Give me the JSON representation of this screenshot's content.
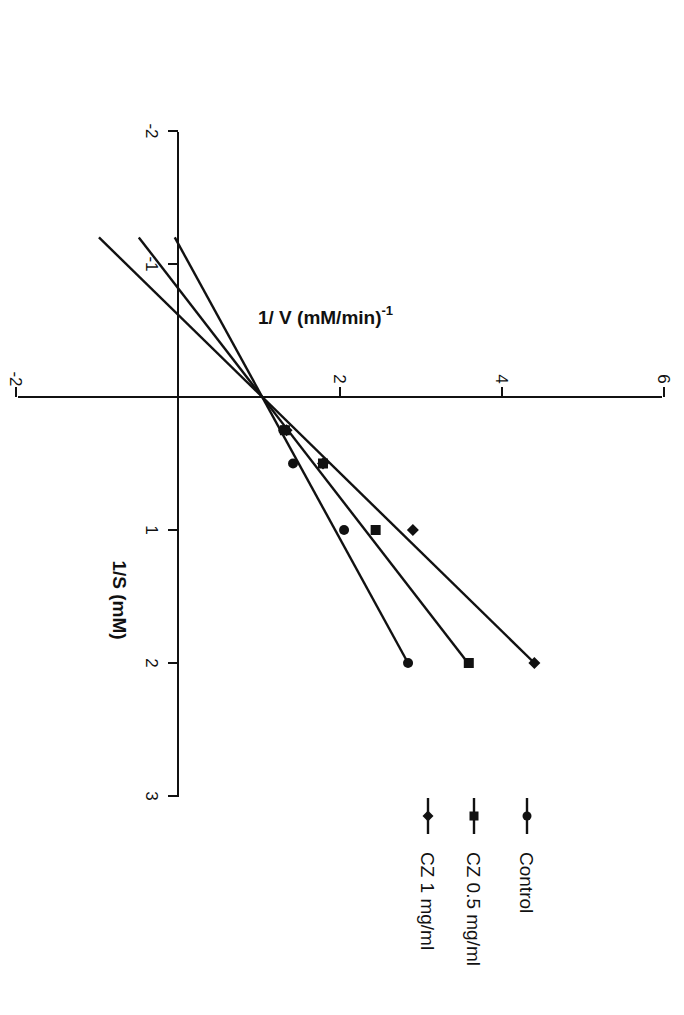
{
  "chart_data": {
    "type": "line",
    "title": "",
    "orientation": "rotated-90-clockwise",
    "xlabel": "1/S (mM)",
    "ylabel": "1/ V (mM/min)",
    "ylabel_superscript": "-1",
    "xlim": [
      -2,
      3
    ],
    "ylim": [
      -2,
      6
    ],
    "x_ticks": [
      -2,
      -1,
      1,
      2,
      3
    ],
    "x_tick_labels": [
      "-2",
      "-1",
      "1",
      "2",
      "3"
    ],
    "y_ticks": [
      -2,
      2,
      4,
      6
    ],
    "y_tick_labels": [
      "-2",
      "2",
      "4",
      "6"
    ],
    "grid": false,
    "legend_position": "bottom-right (rotated)",
    "series": [
      {
        "name": "Control",
        "marker": "circle",
        "x": [
          0.25,
          0.5,
          1,
          2
        ],
        "y": [
          1.3,
          1.42,
          2.05,
          2.84
        ],
        "fit": {
          "slope": 0.9,
          "intercept": 1.04,
          "x_range": [
            -1.2,
            2
          ]
        }
      },
      {
        "name": "CZ 0.5 mg/ml",
        "marker": "square",
        "x": [
          0.25,
          0.5,
          1,
          2
        ],
        "y": [
          1.32,
          1.79,
          2.44,
          3.59
        ],
        "fit": {
          "slope": 1.27,
          "intercept": 1.04,
          "x_range": [
            -1.2,
            2
          ]
        }
      },
      {
        "name": "CZ 1 mg/ml",
        "marker": "diamond",
        "x": [
          0.25,
          0.5,
          1,
          2
        ],
        "y": [
          1.34,
          1.79,
          2.9,
          4.4
        ],
        "fit": {
          "slope": 1.68,
          "intercept": 1.04,
          "x_range": [
            -1.2,
            2
          ]
        }
      }
    ]
  },
  "legend": {
    "items": [
      {
        "label": "Control",
        "marker": "circle"
      },
      {
        "label": "CZ 0.5 mg/ml",
        "marker": "square"
      },
      {
        "label": "CZ 1 mg/ml",
        "marker": "diamond"
      }
    ]
  },
  "colors": {
    "ink": "#111111",
    "background": "#ffffff"
  }
}
